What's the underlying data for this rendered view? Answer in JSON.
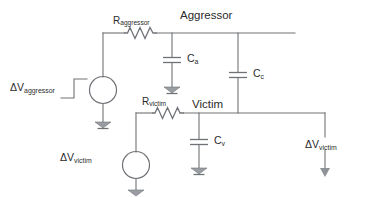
{
  "diagram": {
    "type": "schematic",
    "stroke_color": "#6f7276",
    "text_color": "#2b2b2b",
    "background": "#ffffff"
  },
  "nodes": {
    "aggressor": "Aggressor",
    "victim": "Victim"
  },
  "resistors": [
    {
      "id": "r-aggressor",
      "base": "R",
      "sub": "aggressor"
    },
    {
      "id": "r-victim",
      "base": "R",
      "sub": "victim"
    }
  ],
  "capacitors": [
    {
      "id": "c-a",
      "base": "C",
      "sub": "a"
    },
    {
      "id": "c-c",
      "base": "C",
      "sub": "c"
    },
    {
      "id": "c-v",
      "base": "C",
      "sub": "v"
    }
  ],
  "sources": [
    {
      "id": "src-aggressor",
      "base": "ΔV",
      "sub": "aggressor"
    },
    {
      "id": "src-victim",
      "base": "ΔV",
      "sub": "victim"
    }
  ],
  "outputs": [
    {
      "id": "out-victim",
      "base": "ΔV",
      "sub": "victim"
    }
  ]
}
